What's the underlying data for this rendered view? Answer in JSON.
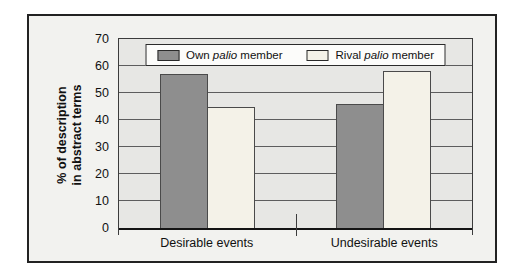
{
  "figure": {
    "background": "#f2f2ef",
    "plot_background": "#e7e7e4",
    "frame_border_color": "#222222",
    "gridline_color": "#5d5d5d"
  },
  "chart_data": {
    "type": "bar",
    "title": "",
    "categories": [
      "Desirable events",
      "Undesirable events"
    ],
    "series": [
      {
        "name": "Own palio member",
        "color": "#8e8e8e",
        "values": [
          57,
          46
        ]
      },
      {
        "name": "Rival palio member",
        "color": "#f4f2e8",
        "values": [
          45,
          58
        ]
      }
    ],
    "xlabel": "",
    "ylabel": "% of description in abstract terms",
    "ylabel_lines": [
      "% of description",
      "in abstract terms"
    ],
    "ylim": [
      0,
      70
    ],
    "yticks": [
      0,
      10,
      20,
      30,
      40,
      50,
      60,
      70
    ],
    "grid": "horizontal",
    "legend_position": "top-center-inside"
  },
  "legend": {
    "entries": [
      {
        "prefix": "Own ",
        "italic": "palio",
        "suffix": " member",
        "color": "#8e8e8e"
      },
      {
        "prefix": "Rival ",
        "italic": "palio",
        "suffix": " member",
        "color": "#f4f2e8"
      }
    ]
  }
}
